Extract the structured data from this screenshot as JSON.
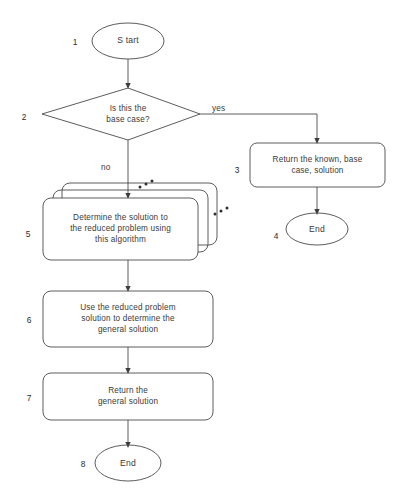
{
  "diagram": {
    "type": "flowchart",
    "stroke_color": "#4a4a4a",
    "text_color": "#3a3a3a",
    "background_color": "#ffffff"
  },
  "nodes": [
    {
      "step": "1",
      "shape": "terminator",
      "label": "S tart"
    },
    {
      "step": "2",
      "shape": "decision",
      "label": "Is this the\nbase case?"
    },
    {
      "step": "3",
      "shape": "process",
      "label": "Return the known, base\ncase, solution"
    },
    {
      "step": "4",
      "shape": "terminator",
      "label": "End"
    },
    {
      "step": "5",
      "shape": "stacked-process",
      "label": "Determine the solution to\nthe reduced problem using\nthis algorithm"
    },
    {
      "step": "6",
      "shape": "process",
      "label": "Use the reduced problem\nsolution to determine the\ngeneral solution"
    },
    {
      "step": "7",
      "shape": "process",
      "label": "Return the\ngeneral solution"
    },
    {
      "step": "8",
      "shape": "terminator",
      "label": "End"
    }
  ],
  "edge_labels": {
    "yes": "yes",
    "no": "no"
  }
}
